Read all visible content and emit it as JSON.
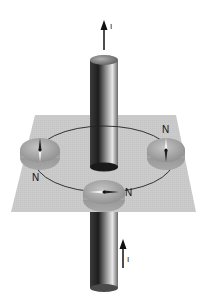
{
  "figure": {
    "current_label_top": "I",
    "current_label_bottom": "I",
    "compasses": [
      {
        "position": "left",
        "north_label": "N"
      },
      {
        "position": "right",
        "north_label": "N"
      },
      {
        "position": "front",
        "north_label": "N"
      }
    ],
    "colors": {
      "plane": "#c9c9c9",
      "compass": "#9a9a9a",
      "wire_dark": "#2a2a2a",
      "wire_light": "#e6e6e6",
      "field_line": "#222222"
    }
  }
}
